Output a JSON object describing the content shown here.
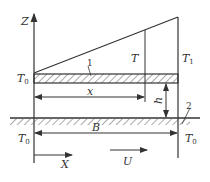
{
  "diagram": {
    "axes": {
      "vertical": "Z",
      "horizontal": "X"
    },
    "labels": {
      "t0_top": "T",
      "t0_top_sub": "0",
      "t_inner": "T",
      "t1": "T",
      "t1_sub": "1",
      "t0_bottom_left": "T",
      "t0_bottom_left_sub": "0",
      "t0_bottom_right": "T",
      "t0_bottom_right_sub": "0",
      "region_1": "1",
      "region_2": "2",
      "dim_x": "x",
      "dim_h": "h",
      "dim_B": "B",
      "flow": "U"
    },
    "colors": {
      "line": "#333333",
      "hatch": "#555555",
      "background": "#ffffff"
    }
  }
}
